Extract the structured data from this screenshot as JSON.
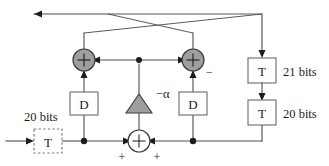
{
  "diagram": {
    "colors": {
      "wire": "#4d4d4d",
      "filled_node": "#9e9e9e",
      "node_border": "#3a3a3a",
      "box_border": "#6b6b6b",
      "text": "#1d1d1d",
      "background": "#ffffff"
    },
    "blocks": {
      "delay_left": {
        "label": "D",
        "name": "delay-left"
      },
      "delay_right": {
        "label": "D",
        "name": "delay-right"
      },
      "quantizer_input": {
        "label": "T",
        "name": "quantizer-input",
        "style": "dashed"
      },
      "quantizer_upper": {
        "label": "T",
        "name": "quantizer-upper",
        "style": "solid"
      },
      "quantizer_lower": {
        "label": "T",
        "name": "quantizer-lower",
        "style": "solid"
      },
      "gain": {
        "label": "−α",
        "name": "gain-triangle"
      }
    },
    "adders": {
      "left": {
        "symbol": "+",
        "name": "adder-left"
      },
      "right": {
        "symbol": "+",
        "name": "adder-right",
        "sign": "−"
      },
      "bottom": {
        "symbol": "+",
        "name": "adder-bottom",
        "sign_left": "+",
        "sign_right": "+"
      }
    },
    "labels": {
      "input_bits": "20 bits",
      "upper_bits": "21 bits",
      "lower_bits": "20 bits"
    }
  }
}
